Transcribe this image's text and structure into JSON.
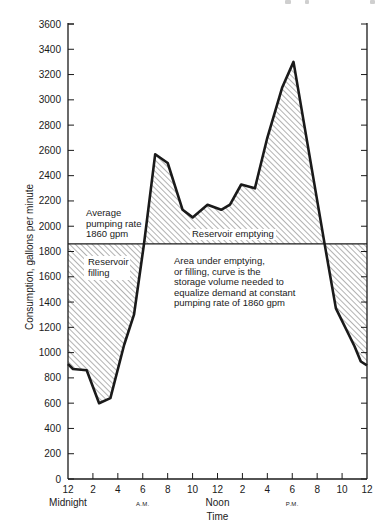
{
  "chart_data": {
    "type": "line",
    "title": "",
    "xlabel": "Time",
    "ylabel": "Consumption, gallons per minute",
    "ylim": [
      0,
      3600
    ],
    "xlim_hours": [
      0,
      24
    ],
    "grid": false,
    "y_ticks": [
      0,
      200,
      400,
      600,
      800,
      1000,
      1200,
      1400,
      1600,
      1800,
      2000,
      2200,
      2400,
      2600,
      2800,
      3000,
      3200,
      3400,
      3600
    ],
    "x_ticks": [
      {
        "hour": 0,
        "label": "12"
      },
      {
        "hour": 2,
        "label": "2"
      },
      {
        "hour": 4,
        "label": "4"
      },
      {
        "hour": 6,
        "label": "6"
      },
      {
        "hour": 8,
        "label": "8"
      },
      {
        "hour": 10,
        "label": "10"
      },
      {
        "hour": 12,
        "label": "12"
      },
      {
        "hour": 14,
        "label": "2"
      },
      {
        "hour": 16,
        "label": "4"
      },
      {
        "hour": 18,
        "label": "6"
      },
      {
        "hour": 20,
        "label": "8"
      },
      {
        "hour": 22,
        "label": "10"
      },
      {
        "hour": 24,
        "label": "12"
      }
    ],
    "x_sublabels": [
      {
        "hour": 0,
        "label": "Midnight",
        "size": "normal"
      },
      {
        "hour": 6,
        "label": "A.M.",
        "size": "small"
      },
      {
        "hour": 12,
        "label": "Noon",
        "size": "normal"
      },
      {
        "hour": 18,
        "label": "P.M.",
        "size": "small"
      }
    ],
    "series": [
      {
        "name": "Consumption",
        "x": [
          0,
          0.4,
          1.5,
          2.5,
          3.4,
          4.5,
          5.3,
          6.1,
          7.0,
          8.0,
          9.2,
          10.0,
          11.2,
          12.3,
          13.0,
          13.9,
          15.0,
          16.0,
          17.2,
          18.1,
          20.6,
          21.5,
          23.0,
          23.5,
          24
        ],
        "values": [
          910,
          870,
          860,
          600,
          640,
          1060,
          1300,
          1860,
          2570,
          2500,
          2130,
          2070,
          2170,
          2130,
          2170,
          2330,
          2300,
          2700,
          3100,
          3300,
          1860,
          1350,
          1050,
          930,
          900
        ]
      }
    ],
    "reference_line": {
      "name": "Average pumping rate",
      "value": 1860
    },
    "annotations": [
      {
        "id": "avg",
        "lines": [
          "Average",
          "pumping rate",
          "1860 gpm"
        ]
      },
      {
        "id": "filling",
        "lines": [
          "Reservoir",
          "filling"
        ]
      },
      {
        "id": "emptying",
        "lines": [
          "Reservoir emptying"
        ]
      },
      {
        "id": "note",
        "lines": [
          "Area under emptying,",
          "or filling, curve is the",
          "storage volume needed to",
          "equalize demand at constant",
          "pumping rate of 1860 gpm"
        ]
      }
    ],
    "shading": "hatched area between curve and 1860 gpm line"
  },
  "colors": {
    "ink": "#1a1a1a",
    "background": "#ffffff",
    "hatch": "#555555"
  }
}
